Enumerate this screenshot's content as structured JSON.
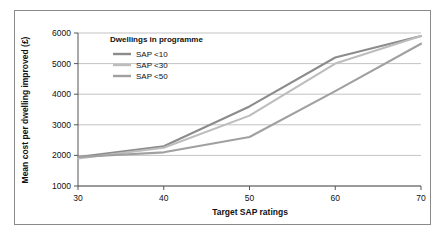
{
  "chart_data": {
    "type": "line",
    "title": "",
    "xlabel": "Target SAP ratings",
    "ylabel": "Mean cost per dwelling improved (£)",
    "x": [
      30,
      40,
      50,
      60,
      70
    ],
    "xtick_labels": [
      "30",
      "40",
      "50",
      "60",
      "70"
    ],
    "ytick_labels": [
      "1000",
      "2000",
      "3000",
      "4000",
      "5000",
      "6000"
    ],
    "yticks": [
      1000,
      2000,
      3000,
      4000,
      5000,
      6000
    ],
    "xlim": [
      30,
      70
    ],
    "ylim": [
      1000,
      6000
    ],
    "grid": "horizontal",
    "legend_position": "inside-top-left",
    "legend_title": "Dwellings in programme",
    "series": [
      {
        "name": "SAP <10",
        "color": "#8c8c8c",
        "values": [
          1950,
          2300,
          3600,
          5200,
          5900
        ]
      },
      {
        "name": "SAP <30",
        "color": "#bdbdbd",
        "values": [
          1900,
          2250,
          3300,
          5000,
          5900
        ]
      },
      {
        "name": "SAP <50",
        "color": "#a0a0a0",
        "values": [
          1950,
          2100,
          2600,
          4100,
          5650
        ]
      }
    ],
    "axis_color": "#555555",
    "grid_color": "#9a9a9a",
    "frame_color": "#8a8a8a",
    "background": "#ffffff"
  }
}
